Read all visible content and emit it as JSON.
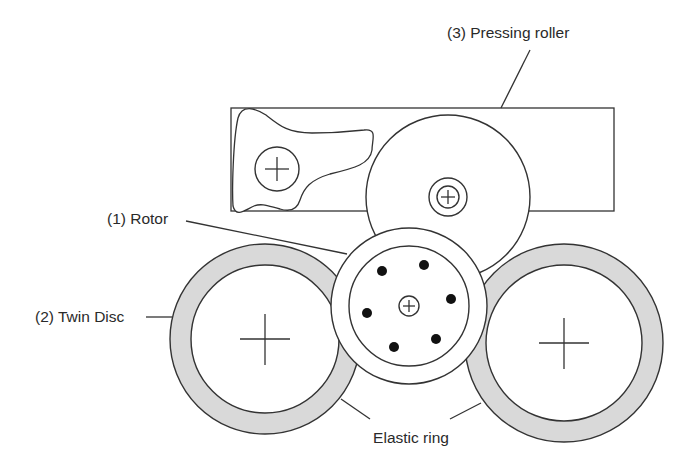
{
  "diagram": {
    "type": "mechanical schematic",
    "labels": {
      "pressing_roller": "(3) Pressing roller",
      "rotor": "(1) Rotor",
      "twin_disc": "(2) Twin Disc",
      "elastic_ring": "Elastic ring"
    },
    "components": [
      {
        "id": 1,
        "name": "Rotor",
        "shape": "circle with 6 holes and central hub"
      },
      {
        "id": 2,
        "name": "Twin Disc",
        "shape": "two discs with elastic rings"
      },
      {
        "id": 3,
        "name": "Pressing roller",
        "shape": "circle in frame with lever arm"
      }
    ],
    "colors": {
      "line": "#333333",
      "ring_fill": "#d9d9d9",
      "background": "#ffffff"
    }
  }
}
